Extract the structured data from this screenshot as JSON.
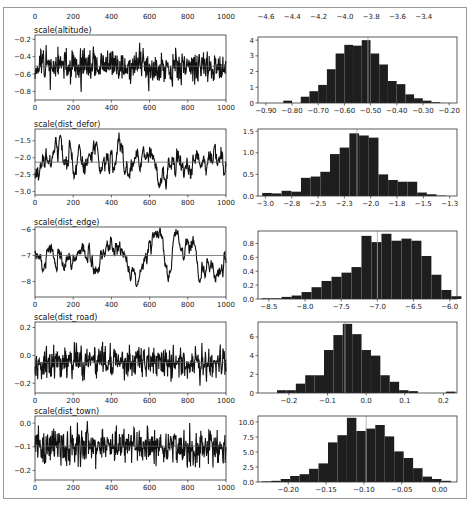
{
  "figure": {
    "top_axis_labels_left": [
      "0",
      "200",
      "400",
      "600",
      "800",
      "1000"
    ],
    "top_axis_labels_right": [
      "-4.6",
      "-4.4",
      "-4.2",
      "-4.0",
      "-3.8",
      "-3.6",
      "-3.4"
    ]
  },
  "chart_data": [
    {
      "type": "line",
      "title": "scale(altitude)",
      "xlabel": "",
      "ylabel": "",
      "xlim": [
        0,
        1000
      ],
      "ylim": [
        -0.9,
        -0.15
      ],
      "xticks": [
        0,
        200,
        400,
        600,
        800,
        1000
      ],
      "yticks": [
        -0.8,
        -0.6,
        -0.4,
        -0.2
      ],
      "mean_line": -0.51,
      "series": [
        {
          "name": "trace",
          "seed": 11,
          "mean": -0.51,
          "sd": 0.1,
          "smooth": 0.2
        }
      ]
    },
    {
      "type": "bar",
      "title": "",
      "xlim": [
        -0.93,
        -0.17
      ],
      "ylim": [
        0,
        4.2
      ],
      "xticks": [
        -0.9,
        -0.8,
        -0.7,
        -0.6,
        -0.5,
        -0.4,
        -0.3,
        -0.2
      ],
      "yticks": [
        0,
        1,
        2,
        3,
        4
      ],
      "mean_line": -0.51,
      "bin_start": -0.9,
      "bin_width": 0.0333,
      "values": [
        0,
        0,
        0.15,
        0,
        0.4,
        0.75,
        1.15,
        2.15,
        3.15,
        3.7,
        3.65,
        4.0,
        3.15,
        2.45,
        1.4,
        1.2,
        0.55,
        0.3,
        0.15,
        0.05
      ]
    },
    {
      "type": "line",
      "title": "scale(dist_defor)",
      "xlim": [
        0,
        1000
      ],
      "ylim": [
        -3.1,
        -1.15
      ],
      "xticks": [
        0,
        200,
        400,
        600,
        800,
        1000
      ],
      "yticks": [
        -3.0,
        -2.5,
        -2.0,
        -1.5
      ],
      "mean_line": -2.13,
      "series": [
        {
          "name": "trace",
          "seed": 23,
          "mean": -2.13,
          "sd": 0.3,
          "smooth": 0.88
        }
      ]
    },
    {
      "type": "bar",
      "title": "",
      "xlim": [
        -3.07,
        -1.18
      ],
      "ylim": [
        0,
        1.55
      ],
      "xticks": [
        -3.0,
        -2.75,
        -2.5,
        -2.25,
        -2.0,
        -1.75,
        -1.5,
        -1.25
      ],
      "yticks": [
        0,
        0.5,
        1.0,
        1.5
      ],
      "mean_line": -2.13,
      "bin_start": -3.03,
      "bin_width": 0.092,
      "values": [
        0.07,
        0.06,
        0.12,
        0.1,
        0.42,
        0.45,
        0.56,
        0.97,
        1.12,
        1.45,
        1.4,
        1.35,
        0.5,
        0.37,
        0.33,
        0.33,
        0.08,
        0.04,
        0.01
      ]
    },
    {
      "type": "line",
      "title": "scale(dist_edge)",
      "xlim": [
        0,
        1000
      ],
      "ylim": [
        -8.6,
        -5.9
      ],
      "xticks": [
        0,
        200,
        400,
        600,
        800,
        1000
      ],
      "yticks": [
        -8,
        -7,
        -6
      ],
      "mean_line": -7.0,
      "series": [
        {
          "name": "trace",
          "seed": 37,
          "mean": -7.0,
          "sd": 0.42,
          "smooth": 0.93
        }
      ]
    },
    {
      "type": "bar",
      "title": "",
      "xlim": [
        -8.65,
        -5.9
      ],
      "ylim": [
        0,
        0.98
      ],
      "xticks": [
        -8.5,
        -8.0,
        -7.5,
        -7.0,
        -6.5,
        -6.0
      ],
      "yticks": [
        0,
        0.2,
        0.4,
        0.6,
        0.8
      ],
      "mean_line": -7.0,
      "bin_start": -8.6,
      "bin_width": 0.138,
      "values": [
        0.01,
        0.01,
        0.03,
        0.05,
        0.1,
        0.17,
        0.26,
        0.32,
        0.38,
        0.46,
        0.91,
        0.82,
        0.94,
        0.84,
        0.87,
        0.84,
        0.62,
        0.35,
        0.13,
        0.04
      ]
    },
    {
      "type": "line",
      "title": "scale(dist_road)",
      "xlim": [
        0,
        1000
      ],
      "ylim": [
        -0.27,
        0.24
      ],
      "xticks": [
        0,
        200,
        400,
        600,
        800,
        1000
      ],
      "yticks": [
        -0.2,
        0.0,
        0.2
      ],
      "mean_line": -0.05,
      "series": [
        {
          "name": "trace",
          "seed": 51,
          "mean": -0.05,
          "sd": 0.06,
          "smooth": 0.1
        }
      ]
    },
    {
      "type": "bar",
      "title": "",
      "xlim": [
        -0.28,
        0.235
      ],
      "ylim": [
        0,
        7.6
      ],
      "xticks": [
        -0.2,
        -0.1,
        0.0,
        0.1,
        0.2
      ],
      "yticks": [
        0,
        2,
        4,
        6
      ],
      "mean_line": -0.055,
      "bin_start": -0.255,
      "bin_width": 0.0243,
      "values": [
        0,
        0.3,
        0.3,
        1.0,
        1.9,
        1.9,
        4.6,
        6.2,
        7.4,
        6.3,
        4.6,
        4.0,
        1.9,
        1.2,
        0.3,
        0.2,
        0,
        0,
        0,
        0.15
      ]
    },
    {
      "type": "line",
      "title": "scale(dist_town)",
      "xlim": [
        0,
        1000
      ],
      "ylim": [
        -0.24,
        0.03
      ],
      "xticks": [
        0,
        200,
        400,
        600,
        800,
        1000
      ],
      "yticks": [
        -0.2,
        -0.1,
        0.0
      ],
      "mean_line": -0.097,
      "series": [
        {
          "name": "trace",
          "seed": 67,
          "mean": -0.097,
          "sd": 0.038,
          "smooth": 0.05
        }
      ]
    },
    {
      "type": "bar",
      "title": "",
      "xlim": [
        -0.24,
        0.023
      ],
      "ylim": [
        0,
        11
      ],
      "xticks": [
        -0.2,
        -0.15,
        -0.1,
        -0.05,
        0.0
      ],
      "yticks": [
        0,
        2.5,
        5.0,
        7.5,
        10.0
      ],
      "ytick_labels": [
        "0.0",
        "2.5",
        "5.0",
        "7.5",
        "10.0"
      ],
      "mean_line": -0.097,
      "bin_start": -0.235,
      "bin_width": 0.0125,
      "values": [
        0.1,
        0.2,
        0.5,
        1.0,
        1.3,
        2.2,
        3.1,
        6.6,
        7.8,
        10.7,
        8.5,
        8.9,
        9.5,
        7.6,
        5.1,
        4.0,
        2.3,
        0.9,
        0.5,
        0.2
      ]
    }
  ]
}
